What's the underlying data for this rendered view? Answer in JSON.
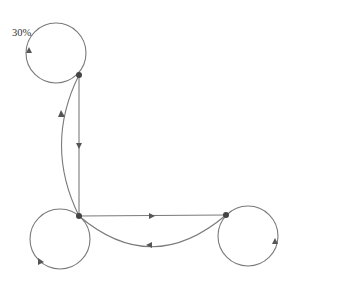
{
  "diagram": {
    "type": "state-transition-graph",
    "colors": {
      "edge": "#7a7a7a",
      "node": "#444444",
      "arrow": "#555555",
      "label": "#333333",
      "background": "#ffffff"
    },
    "nodes": [
      {
        "id": "top",
        "x": 79,
        "y": 75
      },
      {
        "id": "bottom-left",
        "x": 79,
        "y": 216
      },
      {
        "id": "right",
        "x": 226,
        "y": 215
      }
    ],
    "self_loops": [
      {
        "node": "top",
        "cx": 56,
        "cy": 53,
        "r": 30,
        "label": "30%"
      },
      {
        "node": "bottom-left",
        "cx": 60,
        "cy": 239,
        "r": 30,
        "label": ""
      },
      {
        "node": "right",
        "cx": 248,
        "cy": 236,
        "r": 30,
        "label": ""
      }
    ],
    "edges": [
      {
        "from": "top",
        "to": "bottom-left",
        "shape": "straight",
        "arrow_direction": "down"
      },
      {
        "from": "bottom-left",
        "to": "top",
        "shape": "curved",
        "arrow_direction": "up"
      },
      {
        "from": "bottom-left",
        "to": "right",
        "shape": "straight",
        "arrow_direction": "right"
      },
      {
        "from": "right",
        "to": "bottom-left",
        "shape": "curved",
        "arrow_direction": "left"
      }
    ],
    "labels": {
      "top_loop": "30%"
    }
  }
}
